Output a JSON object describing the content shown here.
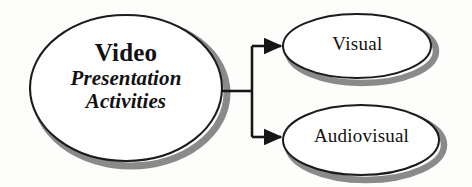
{
  "diagram": {
    "type": "concept-map",
    "background_color": "#fdfdfc",
    "stroke_color": "#1a1a1a",
    "shadow_color": "#8a8a8a",
    "fill_color": "#ffffff",
    "nodes": [
      {
        "id": "main",
        "shape": "ellipse",
        "title": "Video",
        "subtitle_line1": "Presentation",
        "subtitle_line2": "Activities",
        "title_style": "bold",
        "subtitle_style": "bold-italic",
        "cx": 126,
        "cy": 88,
        "rx": 96,
        "ry": 73
      },
      {
        "id": "visual",
        "shape": "ellipse",
        "label": "Visual",
        "label_style": "regular",
        "cx": 357,
        "cy": 46,
        "rx": 74,
        "ry": 32
      },
      {
        "id": "audiovisual",
        "shape": "ellipse",
        "label": "Audiovisual",
        "label_style": "regular",
        "cx": 361,
        "cy": 140,
        "rx": 78,
        "ry": 35
      }
    ],
    "connectors": [
      {
        "id": "main-to-visual",
        "from": "main",
        "to": "visual",
        "arrowhead": "solid-triangle",
        "style": "orthogonal-bracket"
      },
      {
        "id": "main-to-audiovisual",
        "from": "main",
        "to": "audiovisual",
        "arrowhead": "solid-triangle",
        "style": "orthogonal-bracket"
      }
    ],
    "bracket": {
      "stub_y": 91,
      "stub_x_start": 222,
      "spine_x": 252,
      "top_branch_y": 46,
      "bottom_branch_y": 137
    }
  }
}
